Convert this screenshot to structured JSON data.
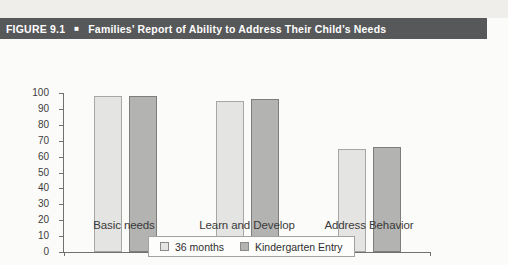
{
  "figure_header": {
    "label": "FIGURE 9.1",
    "separator": "■",
    "title": "Families’ Report of Ability to Address Their Child’s Needs",
    "bg_color": "#57585a",
    "text_color": "#ffffff"
  },
  "chart_data": {
    "type": "bar",
    "title": "Families’ Report of Ability to Address Their Child’s Needs",
    "categories": [
      "Basic needs",
      "Learn and Develop",
      "Address Behavior"
    ],
    "series": [
      {
        "name": "36 months",
        "values": [
          98,
          95,
          65
        ],
        "fill": "#e4e4e2",
        "border": "#a7a7a5"
      },
      {
        "name": "Kindergarten Entry",
        "values": [
          98,
          96,
          66
        ],
        "fill": "#b3b3b1",
        "border": "#7e7e7c"
      }
    ],
    "xlabel": "",
    "ylabel": "",
    "ylim": [
      0,
      100
    ],
    "y_ticks": [
      100,
      90,
      80,
      70,
      60,
      50,
      40,
      30,
      20,
      10,
      0
    ],
    "grid": false,
    "legend_position": "bottom",
    "axis_color": "#707070"
  }
}
